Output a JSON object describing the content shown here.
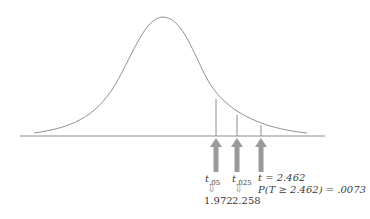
{
  "diagram": {
    "type": "t-distribution density with critical values",
    "labels": {
      "t05": {
        "symbol": "t",
        "subscript": ".05",
        "value": "1.972"
      },
      "t025": {
        "symbol": "t",
        "subscript": ".025",
        "value": "2.258"
      },
      "tstat": {
        "text": "t = 2.462",
        "prob": "P(T ≥ 2.462) = .0073"
      }
    },
    "down_arrow_glyph": "⇩",
    "colors": {
      "curve": "#909090",
      "axis": "#8c8c8c",
      "arrow": "#9a9a9a",
      "text": "#3a3a3a"
    }
  }
}
